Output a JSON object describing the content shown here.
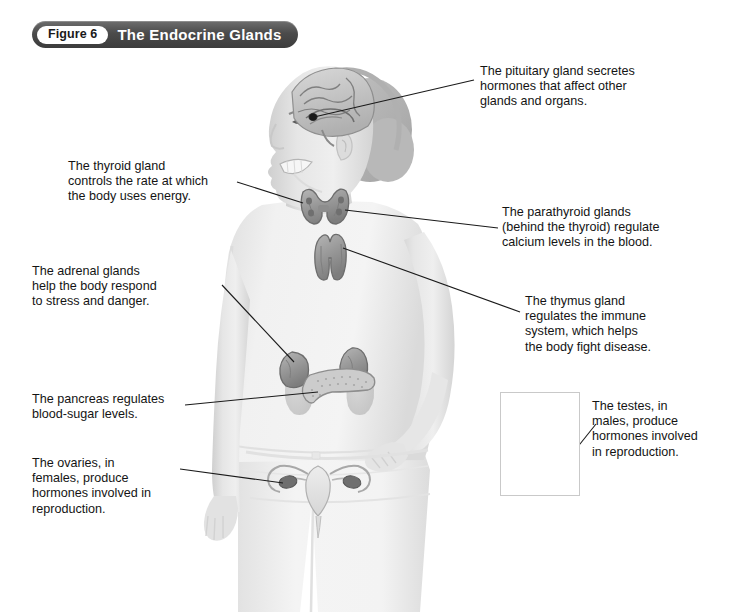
{
  "banner": {
    "figure_pill": "Figure 6",
    "title": "The Endocrine Glands"
  },
  "callouts": [
    {
      "id": "pituitary",
      "text": "The pituitary gland secretes\nhormones that affect other\nglands and organs."
    },
    {
      "id": "thyroid",
      "text": "The thyroid gland\ncontrols the rate at which\nthe body uses energy."
    },
    {
      "id": "parathyroid",
      "text": "The parathyroid glands\n(behind the thyroid) regulate\ncalcium levels in the blood."
    },
    {
      "id": "adrenal",
      "text": "The adrenal glands\nhelp the body respond\nto stress and danger."
    },
    {
      "id": "thymus",
      "text": "The thymus gland\nregulates the immune\nsystem, which helps\nthe body fight disease."
    },
    {
      "id": "pancreas",
      "text": "The pancreas regulates\nblood-sugar levels."
    },
    {
      "id": "testes",
      "text": "The testes, in\nmales, produce\nhormones involved\nin reproduction."
    },
    {
      "id": "ovaries",
      "text": "The ovaries, in\nfemales, produce\nhormones involved in\nreproduction."
    }
  ],
  "colors": {
    "banner_dark": "#4b4b4b",
    "banner_text": "#ffffff",
    "pill_bg": "#ffffff",
    "pill_text": "#1a1a1a",
    "body_text": "#141414",
    "leader_line": "#1a1a1a",
    "gland_fill": "#9a9a9a",
    "gland_stroke": "#6d6d6d",
    "skin_light": "#e4e4e4",
    "shirt_light": "#efefef",
    "jeans_light": "#f2f2f2",
    "hair_dark": "#b4b4b4",
    "inset_border": "#c9c9c9"
  },
  "figure": {
    "glands": [
      "pituitary",
      "thyroid",
      "parathyroid",
      "thymus",
      "adrenal",
      "pancreas",
      "ovaries",
      "testes"
    ]
  }
}
